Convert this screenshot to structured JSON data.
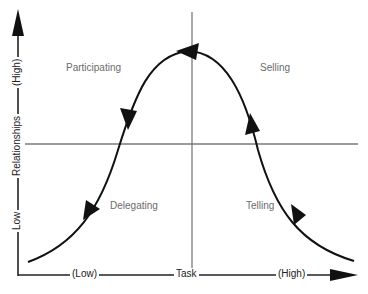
{
  "diagram": {
    "type": "situational-leadership-curve",
    "quadrants": {
      "top_left": "Participating",
      "top_right": "Selling",
      "bottom_left": "Delegating",
      "bottom_right": "Telling"
    },
    "x_axis": {
      "low": "(Low)",
      "title": "Task",
      "high": "(High)"
    },
    "y_axis": {
      "low": "Low",
      "title": "Relationships",
      "high": "(High)"
    },
    "colors": {
      "curve": "#111111",
      "grid": "#7a7a7a",
      "label": "#6b6b6b",
      "axis": "#222222"
    }
  }
}
